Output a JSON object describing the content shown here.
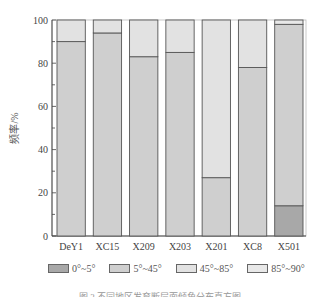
{
  "chart_data": {
    "type": "bar",
    "stacked": true,
    "title": "",
    "xlabel": "",
    "ylabel": "频率/%",
    "ylim": [
      0,
      100
    ],
    "yticks": [
      0,
      20,
      40,
      60,
      80,
      100
    ],
    "grid": false,
    "legend_position": "bottom",
    "categories": [
      "DeY1",
      "XC15",
      "X209",
      "X203",
      "X201",
      "XC8",
      "X501"
    ],
    "series": [
      {
        "name": "0°~5°",
        "color": "#a8a8a8",
        "values": [
          0,
          0,
          0,
          0,
          0,
          0,
          14
        ]
      },
      {
        "name": "5°~45°",
        "color": "#cfcfcf",
        "values": [
          90,
          94,
          83,
          85,
          27,
          78,
          84
        ]
      },
      {
        "name": "45°~85°",
        "color": "#e2e2e2",
        "values": [
          10,
          6,
          17,
          15,
          73,
          22,
          0
        ]
      },
      {
        "name": "85°~90°",
        "color": "#e8e8e8",
        "values": [
          0,
          0,
          0,
          0,
          0,
          0,
          2
        ]
      }
    ]
  },
  "legend": [
    {
      "label": "0°~5°",
      "color": "#a8a8a8"
    },
    {
      "label": "5°~45°",
      "color": "#cfcfcf"
    },
    {
      "label": "45°~85°",
      "color": "#e2e2e2"
    },
    {
      "label": "85°~90°",
      "color": "#e8e8e8"
    }
  ],
  "caption": "图 3  不同地区发育断层面倾角分布直方图"
}
